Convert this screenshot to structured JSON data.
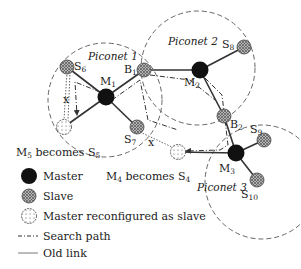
{
  "diagram": {
    "piconets": [
      {
        "id": "piconet-1",
        "label": "Piconet",
        "num": "1",
        "cx": 105,
        "cy": 100,
        "r": 57
      },
      {
        "id": "piconet-2",
        "label": "Piconet",
        "num": "2",
        "cx": 198,
        "cy": 68,
        "r": 57
      },
      {
        "id": "piconet-3",
        "label": "Piconet",
        "num": "3",
        "cx": 262,
        "cy": 182,
        "r": 57
      }
    ],
    "nodes": {
      "M1": {
        "main": "M",
        "sub": "1",
        "type": "master"
      },
      "M2": {
        "main": "M",
        "sub": "2",
        "type": "master"
      },
      "M3": {
        "main": "M",
        "sub": "3",
        "type": "master"
      },
      "S6": {
        "main": "S",
        "sub": "6",
        "type": "slave"
      },
      "S7": {
        "main": "S",
        "sub": "7",
        "type": "slave"
      },
      "S8": {
        "main": "S",
        "sub": "8",
        "type": "slave"
      },
      "S9": {
        "main": "S",
        "sub": "9",
        "type": "slave"
      },
      "S10": {
        "main": "S",
        "sub": "10",
        "type": "slave"
      },
      "B1": {
        "main": "B",
        "sub": "1",
        "type": "slave"
      },
      "B2": {
        "main": "B",
        "sub": "2",
        "type": "slave"
      },
      "M5": {
        "type": "reconfigured"
      },
      "M4": {
        "type": "reconfigured"
      }
    },
    "annotations": {
      "m5_becomes": {
        "a": "M",
        "a_sub": "5",
        "mid": " becomes ",
        "b": "S",
        "b_sub": "5"
      },
      "m4_becomes": {
        "a": "M",
        "a_sub": "4",
        "mid": " becomes ",
        "b": "S",
        "b_sub": "4"
      },
      "break_mark": "x"
    },
    "colors": {
      "master": "#111111",
      "slave": "#9a9a9a",
      "reconfigured": "#ffffff",
      "line": "#333333",
      "dashed_circle": "#555555"
    }
  },
  "legend": {
    "items": [
      {
        "icon": "master-node-icon",
        "label": "Master"
      },
      {
        "icon": "slave-node-icon",
        "label": "Slave"
      },
      {
        "icon": "reconfigured-node-icon",
        "label": "Master reconfigured as slave"
      },
      {
        "icon": "search-path-icon",
        "label": "Search path"
      },
      {
        "icon": "old-link-icon",
        "label": "Old link"
      }
    ]
  }
}
